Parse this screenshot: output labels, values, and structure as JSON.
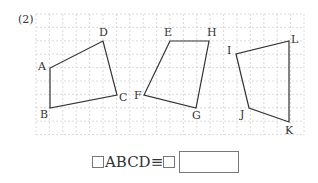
{
  "problem": {
    "number": "(2)"
  },
  "grid": {
    "x0": 36,
    "y0": 14,
    "x1": 304,
    "y1": 135,
    "step": 13.4
  },
  "shapes": [
    {
      "name": "ABCD",
      "points": [
        {
          "label": "A",
          "x": 50,
          "y": 68
        },
        {
          "label": "B",
          "x": 50,
          "y": 108
        },
        {
          "label": "C",
          "x": 117,
          "y": 95
        },
        {
          "label": "D",
          "x": 103,
          "y": 41
        }
      ]
    },
    {
      "name": "EFGH",
      "points": [
        {
          "label": "E",
          "x": 170,
          "y": 41
        },
        {
          "label": "F",
          "x": 144,
          "y": 95
        },
        {
          "label": "G",
          "x": 196,
          "y": 108
        },
        {
          "label": "H",
          "x": 209,
          "y": 41
        }
      ]
    },
    {
      "name": "IJKL",
      "points": [
        {
          "label": "I",
          "x": 236,
          "y": 54
        },
        {
          "label": "J",
          "x": 249,
          "y": 108
        },
        {
          "label": "K",
          "x": 289,
          "y": 122
        },
        {
          "label": "L",
          "x": 289,
          "y": 41
        }
      ]
    }
  ],
  "answer": {
    "left_text": "ABCD",
    "equiv": "≡"
  }
}
